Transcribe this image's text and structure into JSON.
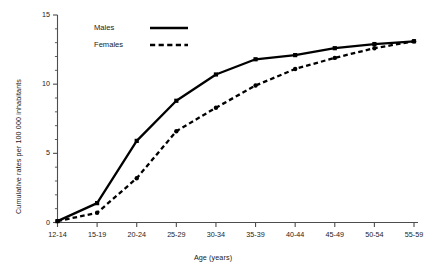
{
  "chart_data": {
    "type": "line",
    "title": "",
    "xlabel": "Age (years)",
    "ylabel": "Cumulative rates per 100 000 inhabitants",
    "categories": [
      "12-14",
      "15-19",
      "20-24",
      "25-29",
      "30-34",
      "35-39",
      "40-44",
      "45-49",
      "50-54",
      "55-59"
    ],
    "series": [
      {
        "name": "Males",
        "style": "solid",
        "marker": "filled-square",
        "values": [
          0.1,
          1.4,
          5.9,
          8.8,
          10.7,
          11.8,
          12.1,
          12.6,
          12.9,
          13.1
        ]
      },
      {
        "name": "Females",
        "style": "dashed",
        "marker": "filled-circle",
        "values": [
          0.1,
          0.7,
          3.2,
          6.6,
          8.3,
          9.9,
          11.1,
          11.9,
          12.6,
          13.1
        ]
      }
    ],
    "ylim": [
      0,
      15
    ],
    "yticks": [
      0,
      5,
      10,
      15
    ],
    "yticks_minor": [
      1,
      2,
      3,
      4,
      6,
      7,
      8,
      9,
      11,
      12,
      13,
      14
    ],
    "grid": false,
    "legend_position": "top-left-inside",
    "colors": {
      "series": "#000000",
      "axis": "#4d4d4d",
      "text": "#1a1a1a",
      "background": "#ffffff"
    }
  },
  "legend": {
    "entries": [
      {
        "label": "Males"
      },
      {
        "label": "Females"
      }
    ]
  },
  "axes": {
    "y_tick_labels": [
      "15",
      "10",
      "5",
      "0"
    ],
    "x_tick_labels": [
      "12-14",
      "15-19",
      "20-24",
      "25-29",
      "30-34",
      "35-39",
      "40-44",
      "45-49",
      "50-54",
      "55-59"
    ],
    "y_axis_title": "Cumulative rates per 100 000 inhabitants",
    "x_axis_title": "Age (years)"
  }
}
